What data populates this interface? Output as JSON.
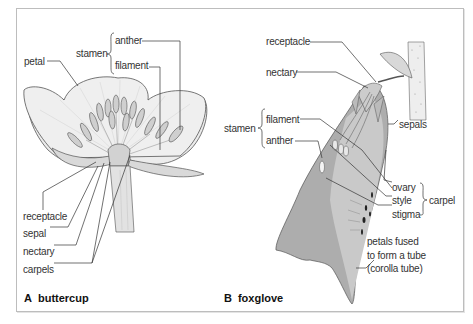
{
  "figure": {
    "panel_a": {
      "letter": "A",
      "title": "buttercup",
      "labels": {
        "petal": "petal",
        "stamen": "stamen",
        "anther": "anther",
        "filament": "filament",
        "receptacle": "receptacle",
        "sepal": "sepal",
        "nectary": "nectary",
        "carpels": "carpels"
      }
    },
    "panel_b": {
      "letter": "B",
      "title": "foxglove",
      "labels": {
        "receptacle": "receptacle",
        "nectary": "nectary",
        "stamen": "stamen",
        "filament": "filament",
        "anther": "anther",
        "sepals": "sepals",
        "ovary": "ovary",
        "style": "style",
        "stigma": "stigma",
        "carpel": "carpel",
        "corolla_line1": "petals fused",
        "corolla_line2": "to form a tube",
        "corolla_line3": "(corolla tube)"
      }
    },
    "colors": {
      "line": "#444444",
      "petal_fill": "#ececec",
      "foxglove_dark": "#a9a9a9",
      "foxglove_light": "#cfcfcf",
      "frame": "#bdbdbd"
    }
  }
}
